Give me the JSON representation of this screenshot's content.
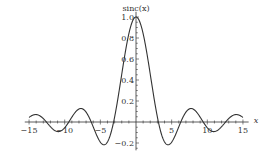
{
  "chart_data": {
    "type": "line",
    "title": "",
    "function": "sinc(x) = sin(x)/x",
    "xlabel": "x",
    "ylabel": "sinc(x)",
    "xlim": [
      -15,
      15
    ],
    "ylim": [
      -0.25,
      1.05
    ],
    "x_ticks": [
      -15,
      -10,
      -5,
      5,
      10,
      15
    ],
    "x_tick_labels": [
      "−15",
      "−10",
      "−5",
      "5",
      "10",
      "15"
    ],
    "y_ticks": [
      -0.2,
      0.2,
      0.4,
      0.6,
      0.8,
      1.0
    ],
    "y_tick_labels": [
      "−0.2",
      "0.2",
      "0.4",
      "0.6",
      "0.8",
      "1.0"
    ],
    "grid": false,
    "legend": null,
    "series": [
      {
        "name": "sinc(x)",
        "color": "#333333",
        "x": [
          -15,
          -14,
          -13,
          -12,
          -11,
          -10,
          -9,
          -8,
          -7,
          -6,
          -5,
          -4,
          -3,
          -2,
          -1,
          0,
          1,
          2,
          3,
          4,
          5,
          6,
          7,
          8,
          9,
          10,
          11,
          12,
          13,
          14,
          15
        ],
        "values": [
          0.043,
          0.071,
          0.032,
          -0.045,
          -0.091,
          -0.054,
          0.046,
          0.124,
          0.094,
          -0.047,
          -0.192,
          -0.189,
          0.047,
          0.455,
          0.841,
          1.0,
          0.841,
          0.455,
          0.047,
          -0.189,
          -0.192,
          -0.047,
          0.094,
          0.124,
          0.046,
          -0.054,
          -0.091,
          -0.045,
          0.032,
          0.071,
          0.043
        ]
      }
    ]
  },
  "plot": {
    "origin_px": [
      136,
      122
    ],
    "x_px_per_unit": 7.13,
    "y_px_per_unit": 105,
    "axis_color": "#333333",
    "curve_color": "#333333"
  }
}
